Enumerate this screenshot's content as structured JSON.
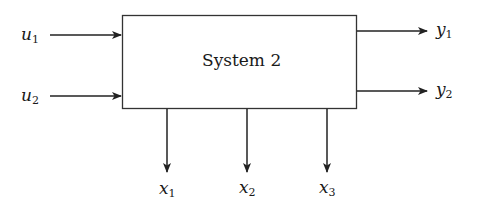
{
  "system": {
    "title": "System 2"
  },
  "inputs": [
    {
      "var": "u",
      "sub": "1"
    },
    {
      "var": "u",
      "sub": "2"
    }
  ],
  "outputs": [
    {
      "var": "y",
      "sub": "1"
    },
    {
      "var": "y",
      "sub": "2"
    }
  ],
  "states": [
    {
      "var": "x",
      "sub": "1"
    },
    {
      "var": "x",
      "sub": "2"
    },
    {
      "var": "x",
      "sub": "3"
    }
  ],
  "colors": {
    "stroke": "#222222",
    "text": "#1a1a1a",
    "background": "#ffffff"
  }
}
